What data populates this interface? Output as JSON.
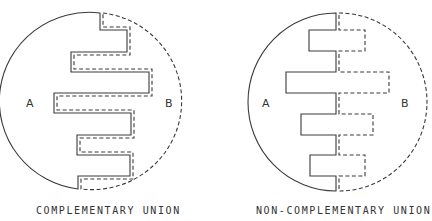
{
  "panels": [
    {
      "id": "complementary",
      "caption": "COMPLEMENTARY UNION",
      "label_a": "A",
      "label_b": "B"
    },
    {
      "id": "non-complementary",
      "caption": "NON-COMPLEMENTARY UNION",
      "label_a": "A",
      "label_b": "B"
    }
  ],
  "colors": {
    "line": "#3a3a3a",
    "background": "#ffffff"
  }
}
